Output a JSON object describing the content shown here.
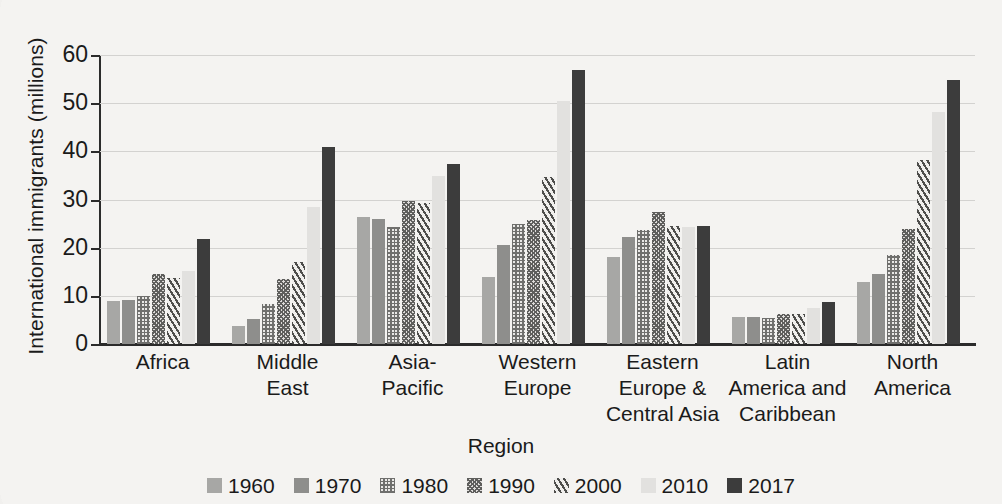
{
  "chart_data": {
    "type": "bar",
    "title": "",
    "xlabel": "Region",
    "ylabel": "International immigrants (millions)",
    "ylim": [
      0,
      60
    ],
    "yticks": [
      0,
      10,
      20,
      30,
      40,
      50,
      60
    ],
    "grid": true,
    "legend_position": "bottom",
    "categories": [
      "Africa",
      "Middle East",
      "Asia-Pacific",
      "Western Europe",
      "Eastern Europe & Central Asia",
      "Latin America and Caribbean",
      "North America"
    ],
    "category_lines": [
      [
        "Africa"
      ],
      [
        "Middle",
        "East"
      ],
      [
        "Asia-",
        "Pacific"
      ],
      [
        "Western",
        "Europe"
      ],
      [
        "Eastern",
        "Europe &",
        "Central Asia"
      ],
      [
        "Latin",
        "America and",
        "Caribbean"
      ],
      [
        "North",
        "America"
      ]
    ],
    "series": [
      {
        "name": "1960",
        "color": "#a7a7a5",
        "pattern": "solid",
        "values": [
          9.0,
          3.8,
          26.3,
          14.0,
          18.0,
          5.7,
          12.8
        ]
      },
      {
        "name": "1970",
        "color": "#8e8e8c",
        "pattern": "solid",
        "values": [
          9.1,
          5.2,
          26.0,
          20.5,
          22.2,
          5.6,
          14.6
        ]
      },
      {
        "name": "1980",
        "color": "#6f6f6d",
        "pattern": "grid-dots",
        "values": [
          9.9,
          8.3,
          24.3,
          25.0,
          23.6,
          5.4,
          18.5
        ]
      },
      {
        "name": "1990",
        "color": "#5e5e5c",
        "pattern": "cross-hatch",
        "values": [
          14.5,
          13.5,
          29.7,
          25.8,
          27.4,
          6.2,
          23.9
        ]
      },
      {
        "name": "2000",
        "color": "#4d4d4b",
        "pattern": "diagonal",
        "values": [
          13.8,
          17.0,
          29.3,
          34.7,
          24.4,
          6.3,
          38.2
        ]
      },
      {
        "name": "2010",
        "color": "#e2e1df",
        "pattern": "solid",
        "values": [
          15.2,
          28.5,
          34.8,
          50.5,
          24.3,
          7.5,
          48.2
        ]
      },
      {
        "name": "2017",
        "color": "#3c3c3c",
        "pattern": "solid",
        "values": [
          21.7,
          40.8,
          37.3,
          56.8,
          24.6,
          8.8,
          54.8
        ]
      }
    ]
  },
  "axis": {
    "y_title": "International immigrants (millions)",
    "x_title": "Region",
    "y_tick_labels": [
      "60",
      "50",
      "40",
      "30",
      "20",
      "10",
      "0"
    ]
  },
  "legend": {
    "items": [
      {
        "label": "1960"
      },
      {
        "label": "1970"
      },
      {
        "label": "1980"
      },
      {
        "label": "1990"
      },
      {
        "label": "2000"
      },
      {
        "label": "2010"
      },
      {
        "label": "2017"
      }
    ]
  },
  "colors": {
    "background": "#f4f3f1",
    "axis": "#2b2b2b",
    "gridline": "#d3d2d0",
    "text": "#1a1a1a"
  }
}
